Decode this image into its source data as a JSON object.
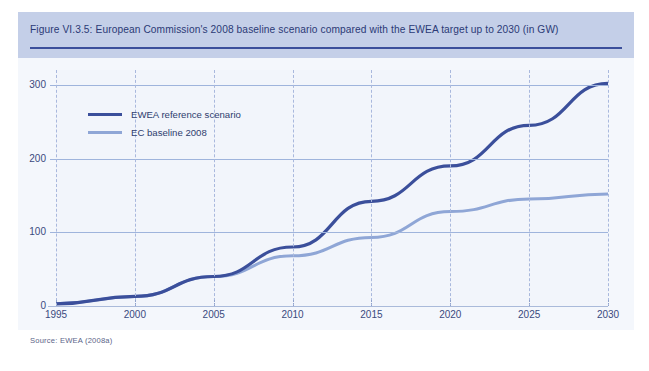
{
  "figure": {
    "title": "Figure VI.3.5: European Commission's 2008 baseline scenario compared with the EWEA target up to 2030 (in GW)",
    "source": "Source: EWEA (2008a)"
  },
  "colors": {
    "band": "#c4cfe8",
    "title_text": "#2b3a76",
    "title_rule": "#3b4f9b",
    "plot_bg": "#f2f5fb",
    "gridline": "#9fb4dc",
    "vgrid": "#a9b8dd",
    "series_ewea": "#3b4f9b",
    "series_ec": "#8fa6d6",
    "axis_text": "#3a4a7e"
  },
  "chart_data": {
    "type": "line",
    "title": "European Commission's 2008 baseline scenario compared with the EWEA target up to 2030 (in GW)",
    "xlabel": "",
    "ylabel": "",
    "unit": "GW",
    "grid": true,
    "legend_position": "inside-top-left",
    "x": [
      1995,
      2000,
      2005,
      2010,
      2015,
      2020,
      2025,
      2030
    ],
    "categories": [
      "1995",
      "2000",
      "2005",
      "2010",
      "2015",
      "2020",
      "2025",
      "2030"
    ],
    "xlim": [
      1995,
      2030
    ],
    "ylim": [
      0,
      320
    ],
    "yticks": [
      0,
      100,
      200,
      300
    ],
    "ytick_labels": [
      "0",
      "100",
      "200",
      "300"
    ],
    "series": [
      {
        "name": "EWEA reference scenario",
        "color": "#3b4f9b",
        "values": [
          3,
          13,
          40,
          80,
          142,
          190,
          245,
          302
        ]
      },
      {
        "name": "EC baseline 2008",
        "color": "#8fa6d6",
        "values": [
          3,
          13,
          40,
          68,
          93,
          128,
          145,
          152
        ]
      }
    ]
  }
}
